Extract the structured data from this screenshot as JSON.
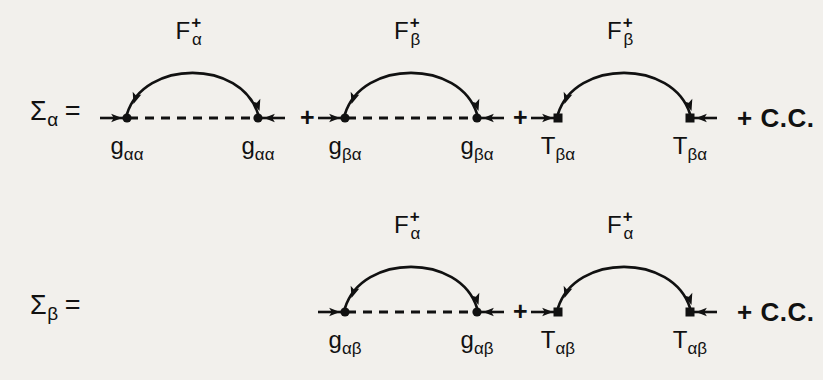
{
  "figure": {
    "background_color": "#f2f0ec",
    "ink_color": "#111111",
    "rows": [
      {
        "id": "sigma-alpha",
        "lhs": {
          "symbol": "Σ",
          "subscript": "α",
          "equals": "="
        },
        "baseline_y": 118,
        "terms": [
          {
            "id": "term-g-alpha-alpha",
            "vertex_shape": "circle",
            "baseline_style": "dashed",
            "x_left": 127,
            "x_right": 258,
            "arc_label": {
              "base": "F",
              "sup": "+",
              "sub": "α"
            },
            "vertex_label": {
              "base": "g",
              "sub": "αα"
            }
          },
          {
            "id": "term-g-beta-alpha",
            "vertex_shape": "circle",
            "baseline_style": "dashed",
            "x_left": 345,
            "x_right": 477,
            "arc_label": {
              "base": "F",
              "sup": "+",
              "sub": "β"
            },
            "vertex_label": {
              "base": "g",
              "sub": "βα"
            }
          },
          {
            "id": "term-T-beta-alpha",
            "vertex_shape": "square",
            "baseline_style": "none",
            "x_left": 558,
            "x_right": 690,
            "arc_label": {
              "base": "F",
              "sup": "+",
              "sub": "β"
            },
            "vertex_label": {
              "base": "T",
              "sub": "βα"
            }
          }
        ],
        "plus_positions": [
          300,
          513
        ],
        "plus_label": "+",
        "cc_label": "+ C.C.",
        "cc_x": 737
      },
      {
        "id": "sigma-beta",
        "lhs": {
          "symbol": "Σ",
          "subscript": "β",
          "equals": "="
        },
        "baseline_y": 312,
        "terms": [
          {
            "id": "term-g-alpha-beta",
            "vertex_shape": "circle",
            "baseline_style": "dashed",
            "x_left": 345,
            "x_right": 477,
            "arc_label": {
              "base": "F",
              "sup": "+",
              "sub": "α"
            },
            "vertex_label": {
              "base": "g",
              "sub": "αβ"
            }
          },
          {
            "id": "term-T-alpha-beta",
            "vertex_shape": "square",
            "baseline_style": "none",
            "x_left": 558,
            "x_right": 690,
            "arc_label": {
              "base": "F",
              "sup": "+",
              "sub": "α"
            },
            "vertex_label": {
              "base": "T",
              "sub": "αβ"
            }
          }
        ],
        "plus_positions": [
          513
        ],
        "plus_label": "+",
        "cc_label": "+ C.C.",
        "cc_x": 737
      }
    ]
  }
}
